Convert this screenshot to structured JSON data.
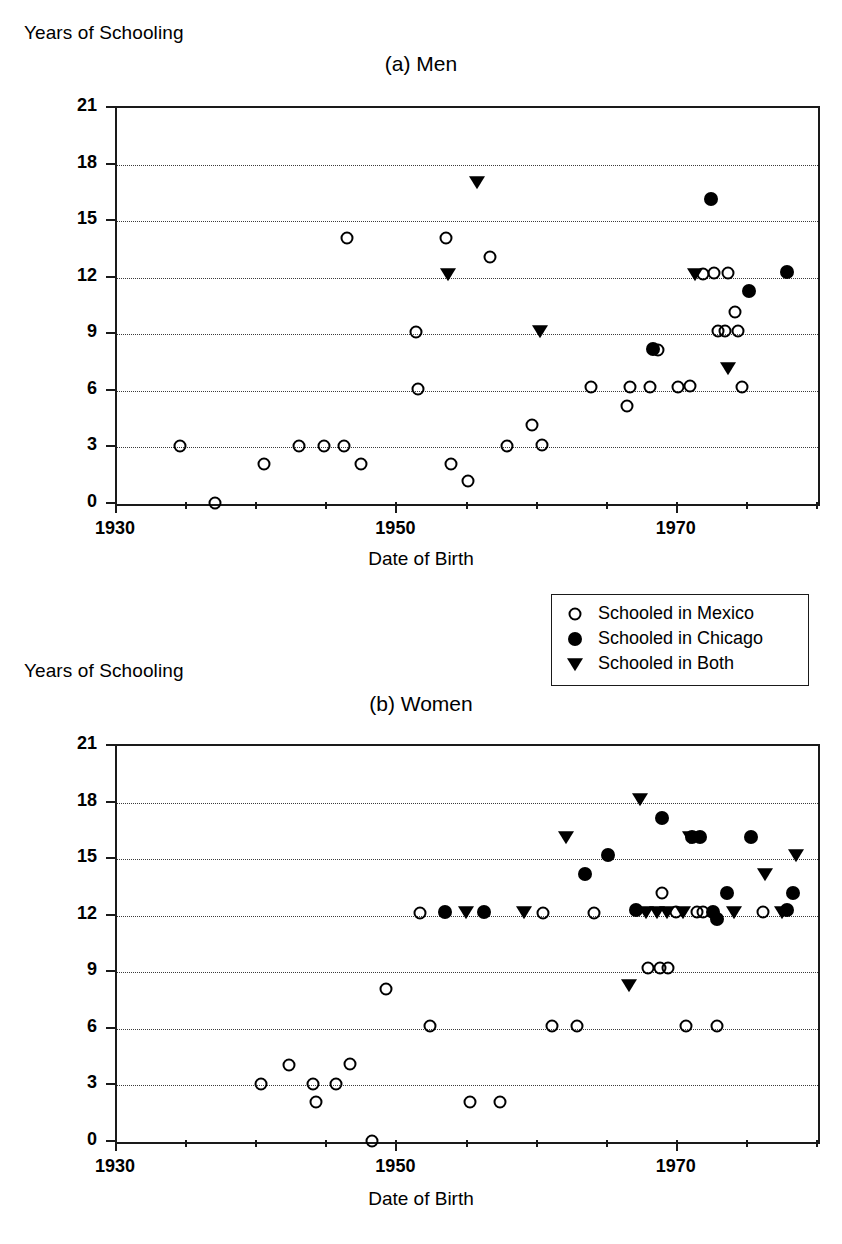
{
  "figure": {
    "y_axis_label": "Years of Schooling",
    "x_axis_label": "Date of Birth"
  },
  "legend": {
    "items": [
      {
        "label": "Schooled in Mexico",
        "marker": "open-circle"
      },
      {
        "label": "Schooled in Chicago",
        "marker": "filled-circle"
      },
      {
        "label": "Schooled in Both",
        "marker": "filled-triangle-down"
      }
    ]
  },
  "chart_data": [
    {
      "type": "scatter",
      "title": "(a) Men",
      "xlabel": "Date of Birth",
      "ylabel": "Years of Schooling",
      "xlim": [
        1930,
        1980
      ],
      "ylim": [
        0,
        21
      ],
      "xticks": [
        1930,
        1950,
        1970
      ],
      "xtick_labels": [
        "1930",
        "1950",
        "1970"
      ],
      "xminor_step": 5,
      "yticks": [
        0,
        3,
        6,
        9,
        12,
        15,
        18,
        21
      ],
      "ytick_labels": [
        "0",
        "3",
        "6",
        "9",
        "12",
        "15",
        "18",
        "21"
      ],
      "grid": "horizontal-dotted",
      "legend_position": "below-right",
      "series": [
        {
          "name": "Schooled in Mexico",
          "marker": "open-circle",
          "points": [
            [
              1934.5,
              3.05
            ],
            [
              1937.0,
              0.05
            ],
            [
              1940.5,
              2.1
            ],
            [
              1943.0,
              3.1
            ],
            [
              1944.8,
              3.1
            ],
            [
              1946.2,
              3.1
            ],
            [
              1946.4,
              14.1
            ],
            [
              1947.4,
              2.1
            ],
            [
              1951.3,
              9.1
            ],
            [
              1951.5,
              6.1
            ],
            [
              1953.5,
              14.1
            ],
            [
              1953.8,
              2.1
            ],
            [
              1955.0,
              1.2
            ],
            [
              1956.6,
              13.1
            ],
            [
              1957.8,
              3.1
            ],
            [
              1959.6,
              4.2
            ],
            [
              1960.3,
              3.15
            ],
            [
              1963.8,
              6.2
            ],
            [
              1966.4,
              5.2
            ],
            [
              1966.6,
              6.2
            ],
            [
              1968.0,
              6.2
            ],
            [
              1968.6,
              8.15
            ],
            [
              1970.0,
              6.2
            ],
            [
              1970.9,
              6.25
            ],
            [
              1971.8,
              12.2
            ],
            [
              1972.6,
              12.25
            ],
            [
              1972.9,
              9.2
            ],
            [
              1973.4,
              9.15
            ],
            [
              1973.6,
              12.25
            ],
            [
              1974.1,
              10.2
            ],
            [
              1974.3,
              9.2
            ],
            [
              1974.6,
              6.2
            ]
          ]
        },
        {
          "name": "Schooled in Chicago",
          "marker": "filled-circle",
          "points": [
            [
              1968.2,
              8.2
            ],
            [
              1972.4,
              16.2
            ],
            [
              1975.1,
              11.3
            ],
            [
              1977.8,
              12.3
            ]
          ]
        },
        {
          "name": "Schooled in Both",
          "marker": "filled-triangle-down",
          "points": [
            [
              1953.6,
              12.2
            ],
            [
              1955.7,
              17.1
            ],
            [
              1960.2,
              9.2
            ],
            [
              1971.2,
              12.2
            ],
            [
              1973.6,
              7.2
            ]
          ]
        }
      ]
    },
    {
      "type": "scatter",
      "title": "(b) Women",
      "xlabel": "Date of Birth",
      "ylabel": "Years of Schooling",
      "xlim": [
        1930,
        1980
      ],
      "ylim": [
        0,
        21
      ],
      "xticks": [
        1930,
        1950,
        1970
      ],
      "xtick_labels": [
        "1930",
        "1950",
        "1970"
      ],
      "xminor_step": 5,
      "yticks": [
        0,
        3,
        6,
        9,
        12,
        15,
        18,
        21
      ],
      "ytick_labels": [
        "0",
        "3",
        "6",
        "9",
        "12",
        "15",
        "18",
        "21"
      ],
      "grid": "horizontal-dotted",
      "legend_position": "shared",
      "series": [
        {
          "name": "Schooled in Mexico",
          "marker": "open-circle",
          "points": [
            [
              1940.3,
              3.05
            ],
            [
              1942.3,
              4.1
            ],
            [
              1944.0,
              3.1
            ],
            [
              1944.2,
              2.1
            ],
            [
              1945.6,
              3.1
            ],
            [
              1946.6,
              4.15
            ],
            [
              1948.2,
              0.05
            ],
            [
              1949.2,
              8.1
            ],
            [
              1951.6,
              12.15
            ],
            [
              1952.3,
              6.15
            ],
            [
              1955.2,
              2.1
            ],
            [
              1957.3,
              2.1
            ],
            [
              1960.4,
              12.15
            ],
            [
              1961.0,
              6.15
            ],
            [
              1962.8,
              6.15
            ],
            [
              1964.0,
              12.15
            ],
            [
              1967.9,
              9.25
            ],
            [
              1968.7,
              9.25
            ],
            [
              1969.3,
              9.25
            ],
            [
              1968.9,
              13.2
            ],
            [
              1969.9,
              12.2
            ],
            [
              1970.6,
              6.15
            ],
            [
              1971.4,
              12.2
            ],
            [
              1971.8,
              12.2
            ],
            [
              1972.8,
              6.15
            ],
            [
              1976.1,
              12.2
            ]
          ]
        },
        {
          "name": "Schooled in Chicago",
          "marker": "filled-circle",
          "points": [
            [
              1953.4,
              12.2
            ],
            [
              1956.2,
              12.2
            ],
            [
              1963.4,
              14.2
            ],
            [
              1965.0,
              15.2
            ],
            [
              1967.0,
              12.3
            ],
            [
              1968.9,
              17.2
            ],
            [
              1971.0,
              16.2
            ],
            [
              1971.6,
              16.2
            ],
            [
              1972.5,
              12.2
            ],
            [
              1972.8,
              11.8
            ],
            [
              1973.5,
              13.2
            ],
            [
              1975.2,
              16.2
            ],
            [
              1977.8,
              12.3
            ],
            [
              1978.2,
              13.2
            ]
          ]
        },
        {
          "name": "Schooled in Both",
          "marker": "filled-triangle-down",
          "points": [
            [
              1954.9,
              12.2
            ],
            [
              1959.0,
              12.2
            ],
            [
              1962.0,
              16.2
            ],
            [
              1966.5,
              8.3
            ],
            [
              1967.3,
              18.2
            ],
            [
              1967.7,
              12.2
            ],
            [
              1968.5,
              12.2
            ],
            [
              1969.2,
              12.2
            ],
            [
              1970.4,
              12.2
            ],
            [
              1970.9,
              16.2
            ],
            [
              1974.0,
              12.2
            ],
            [
              1976.2,
              14.2
            ],
            [
              1977.4,
              12.2
            ],
            [
              1978.4,
              15.2
            ]
          ]
        }
      ]
    }
  ]
}
